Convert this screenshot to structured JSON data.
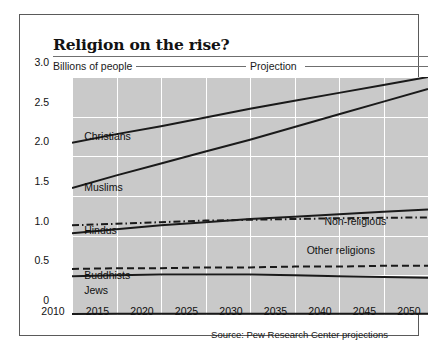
{
  "title": "Religion on the rise?",
  "axis_title": "Billions of people",
  "projection_label": "Projection",
  "source": "Source: Pew Research Center projections",
  "chart_data": {
    "type": "line",
    "title": "Religion on the rise?",
    "subtitle": "Projection",
    "xlabel": "",
    "ylabel": "Billions of people",
    "xlim": [
      2010,
      2050
    ],
    "ylim": [
      0,
      3.0
    ],
    "grid": true,
    "legend": "inline-labels",
    "x": [
      2010,
      2015,
      2020,
      2025,
      2030,
      2035,
      2040,
      2045,
      2050
    ],
    "xticklabels": [
      "2010",
      "2015",
      "2020",
      "2025",
      "2030",
      "2035",
      "2040",
      "2045",
      "2050"
    ],
    "yticks": [
      0,
      0.5,
      1.0,
      1.5,
      2.0,
      2.5,
      3.0
    ],
    "yticklabels": [
      "0",
      "0.5",
      "1.0",
      "1.5",
      "2.0",
      "2.5",
      "3.0"
    ],
    "series": [
      {
        "name": "Christians",
        "style": "solid",
        "label_x": 2013.5,
        "label_y": 2.07,
        "values": [
          2.17,
          2.28,
          2.38,
          2.49,
          2.6,
          2.7,
          2.8,
          2.9,
          3.0
        ]
      },
      {
        "name": "Muslims",
        "style": "solid",
        "label_x": 2013.5,
        "label_y": 1.43,
        "values": [
          1.6,
          1.76,
          1.91,
          2.06,
          2.21,
          2.37,
          2.53,
          2.69,
          2.85
        ]
      },
      {
        "name": "Non-religious",
        "style": "dash-dot",
        "label_x": 2040.5,
        "label_y": 1.0,
        "values": [
          1.13,
          1.15,
          1.17,
          1.19,
          1.2,
          1.21,
          1.22,
          1.225,
          1.23
        ]
      },
      {
        "name": "Hindus",
        "style": "solid",
        "label_x": 2013.5,
        "label_y": 0.88,
        "values": [
          1.03,
          1.08,
          1.13,
          1.17,
          1.21,
          1.24,
          1.27,
          1.3,
          1.33
        ]
      },
      {
        "name": "Other religions",
        "style": "dashed",
        "label_x": 2038.5,
        "label_y": 0.63,
        "values": [
          0.58,
          0.59,
          0.59,
          0.6,
          0.6,
          0.61,
          0.61,
          0.62,
          0.62
        ]
      },
      {
        "name": "Buddhists",
        "style": "solid",
        "label_x": 2013.5,
        "label_y": 0.32,
        "values": [
          0.49,
          0.5,
          0.51,
          0.51,
          0.51,
          0.5,
          0.49,
          0.48,
          0.47
        ]
      },
      {
        "name": "Jews",
        "style": "solid",
        "label_x": 2013.5,
        "label_y": 0.13,
        "values": [
          0.014,
          0.015,
          0.015,
          0.016,
          0.016,
          0.016,
          0.017,
          0.017,
          0.017
        ]
      }
    ]
  },
  "colors": {
    "plot_background": "#c9c9c9",
    "gridline": "#ffffff",
    "line": "#1a1a1a",
    "frame": "#5a5a5a",
    "text": "#111111"
  }
}
